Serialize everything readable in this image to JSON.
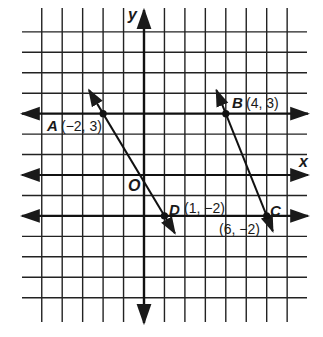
{
  "diagram": {
    "type": "coordinate-grid",
    "grid": {
      "x_min": -5,
      "x_max": 7,
      "y_min": -6,
      "y_max": 7,
      "line_color": "#1a1a1a"
    },
    "axes": {
      "x_label": "x",
      "y_label": "y",
      "origin_label": "O"
    },
    "horizontal_lines": [
      {
        "name": "line-y-3",
        "y": 3
      },
      {
        "name": "x-axis",
        "y": 0
      },
      {
        "name": "line-y-neg2",
        "y": -2
      }
    ],
    "points": [
      {
        "id": "A",
        "name": "A",
        "coords": "(−2, 3)",
        "x": -2,
        "y": 3
      },
      {
        "id": "B",
        "name": "B",
        "coords": "(4, 3)",
        "x": 4,
        "y": 3
      },
      {
        "id": "C",
        "name": "C",
        "coords": "(6, −2)",
        "x": 6,
        "y": -2
      },
      {
        "id": "D",
        "name": "D",
        "coords": "(1, −2)",
        "x": 1,
        "y": -2
      }
    ],
    "slanted_lines": [
      {
        "name": "line-AD",
        "through": [
          "A",
          "D"
        ]
      },
      {
        "name": "line-BC",
        "through": [
          "B",
          "C"
        ]
      }
    ]
  }
}
